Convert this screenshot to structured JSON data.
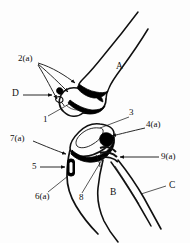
{
  "figure": {
    "background_color": "#fdfdfd",
    "line_color": "#101010",
    "fill_color": "#000000"
  },
  "part_labels": [
    {
      "id": "part-a",
      "text": "A",
      "x": 116,
      "y": 66,
      "meaning": "humerus"
    },
    {
      "id": "part-b",
      "text": "B",
      "x": 110,
      "y": 192,
      "meaning": "ulna"
    },
    {
      "id": "part-c",
      "text": "C",
      "x": 169,
      "y": 185,
      "meaning": "radius"
    },
    {
      "id": "part-d",
      "text": "D",
      "x": 13,
      "y": 93,
      "meaning": "detached fragments"
    }
  ],
  "callout_labels": [
    {
      "id": "callout-2a",
      "text": "2(a)",
      "x": 20,
      "y": 59
    },
    {
      "id": "callout-1",
      "text": "1",
      "x": 44,
      "y": 119
    },
    {
      "id": "callout-3",
      "text": "3",
      "x": 130,
      "y": 112
    },
    {
      "id": "callout-4a",
      "text": "4(a)",
      "x": 147,
      "y": 124
    },
    {
      "id": "callout-7a",
      "text": "7(a)",
      "x": 14,
      "y": 138
    },
    {
      "id": "callout-9a",
      "text": "9(a)",
      "x": 162,
      "y": 155
    },
    {
      "id": "callout-5",
      "text": "5",
      "x": 34,
      "y": 158
    },
    {
      "id": "callout-6a",
      "text": "6(a)",
      "x": 40,
      "y": 196
    },
    {
      "id": "callout-8",
      "text": "8",
      "x": 80,
      "y": 197
    }
  ]
}
